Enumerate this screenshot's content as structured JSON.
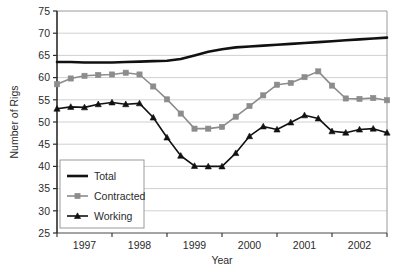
{
  "chart_data": {
    "type": "line",
    "title": "",
    "xlabel": "Year",
    "ylabel": "Number of Rigs",
    "ylim": [
      25,
      75
    ],
    "yticks": [
      25,
      30,
      35,
      40,
      45,
      50,
      55,
      60,
      65,
      70,
      75
    ],
    "xlim": [
      1996.75,
      2002.75
    ],
    "xtick_labels": [
      "1997",
      "1998",
      "1999",
      "2000",
      "2001",
      "2002"
    ],
    "xtick_label_positions": [
      1997.25,
      1998.25,
      1999.25,
      2000.25,
      2001.25,
      2002.25
    ],
    "xtick_positions": [
      1996.75,
      1997.75,
      1998.75,
      1999.75,
      2000.75,
      2001.75,
      2002.75
    ],
    "grid": "horizontal",
    "legend_position": "lower-left-inside",
    "x": [
      1996.75,
      1997.0,
      1997.25,
      1997.5,
      1997.75,
      1998.0,
      1998.25,
      1998.5,
      1998.75,
      1999.0,
      1999.25,
      1999.5,
      1999.75,
      2000.0,
      2000.25,
      2000.5,
      2000.75,
      2001.0,
      2001.25,
      2001.5,
      2001.75,
      2002.0,
      2002.25,
      2002.5,
      2002.75
    ],
    "series": [
      {
        "name": "Total",
        "color": "#111111",
        "marker": "none",
        "line_width": 2.6,
        "values": [
          63.5,
          63.5,
          63.4,
          63.4,
          63.4,
          63.5,
          63.6,
          63.7,
          63.8,
          64.2,
          65.0,
          65.8,
          66.4,
          66.8,
          67.0,
          67.2,
          67.4,
          67.6,
          67.8,
          68.0,
          68.2,
          68.4,
          68.6,
          68.8,
          69.0
        ]
      },
      {
        "name": "Contracted",
        "color": "#8c8c8c",
        "marker": "square",
        "line_width": 1.6,
        "values": [
          58.5,
          59.8,
          60.4,
          60.6,
          60.7,
          61.1,
          60.7,
          58.0,
          55.1,
          51.9,
          48.5,
          48.5,
          48.9,
          51.2,
          53.6,
          56.0,
          58.4,
          58.8,
          60.1,
          61.4,
          58.2,
          55.3,
          55.2,
          55.4,
          54.9
        ]
      },
      {
        "name": "Working",
        "color": "#111111",
        "marker": "triangle",
        "line_width": 1.6,
        "values": [
          53.0,
          53.4,
          53.3,
          54.0,
          54.4,
          54.0,
          54.2,
          51.0,
          46.5,
          42.4,
          40.1,
          40.0,
          40.0,
          43.0,
          46.8,
          49.0,
          48.3,
          49.9,
          51.5,
          50.8,
          47.9,
          47.6,
          48.3,
          48.5,
          47.6
        ]
      }
    ]
  },
  "legend": {
    "items": [
      {
        "label": "Total"
      },
      {
        "label": "Contracted"
      },
      {
        "label": "Working"
      }
    ]
  },
  "axes": {
    "y_title": "Number of Rigs",
    "x_title": "Year"
  }
}
